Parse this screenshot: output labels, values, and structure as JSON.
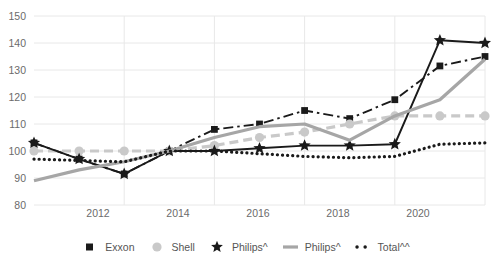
{
  "chart_data": {
    "type": "line",
    "title": "",
    "xlabel": "",
    "ylabel": "",
    "x": [
      2010,
      2011,
      2012,
      2013,
      2014,
      2015,
      2016,
      2017,
      2018,
      2019,
      2020
    ],
    "xlim": [
      2010,
      2020
    ],
    "ylim": [
      80,
      150
    ],
    "ytick_labels": [
      "150",
      "140",
      "130",
      "120",
      "110",
      "100",
      "90",
      "80"
    ],
    "ytick_values": [
      150,
      140,
      130,
      120,
      110,
      100,
      90,
      80
    ],
    "xtick_labels": [
      "2012",
      "2014",
      "2016",
      "2018",
      "2020"
    ],
    "xtick_values": [
      2012,
      2014,
      2016,
      2018,
      2020
    ],
    "grid": true,
    "legend_position": "bottom",
    "series": [
      {
        "name": "Exxon",
        "marker": "square",
        "color": "#1a1a1a",
        "style": "dash-dot",
        "values": [
          103,
          97,
          91.5,
          100,
          108,
          110,
          115,
          112,
          119,
          131.5,
          135
        ]
      },
      {
        "name": "Shell",
        "marker": "circle",
        "color": "#c9c9c9",
        "style": "dashed",
        "values": [
          100,
          100,
          100,
          100,
          102,
          105,
          107,
          110,
          113,
          113,
          113
        ]
      },
      {
        "name": "Philips^",
        "marker": "star",
        "color": "#1a1a1a",
        "style": "solid",
        "values": [
          103,
          97,
          91.5,
          100,
          100,
          101,
          102,
          102,
          102.5,
          141,
          140
        ]
      },
      {
        "name": "Philips^",
        "marker": "none",
        "color": "#a6a6a6",
        "style": "solid",
        "values": [
          89,
          93,
          96,
          100,
          105,
          109,
          110,
          104,
          113,
          119,
          134
        ]
      },
      {
        "name": "Total^^",
        "marker": "dot",
        "color": "#1a1a1a",
        "style": "dotted",
        "values": [
          97,
          96.5,
          96,
          100,
          100,
          99,
          98,
          97.5,
          98,
          102.5,
          103
        ]
      }
    ]
  },
  "legend": {
    "items": [
      {
        "label": "Exxon",
        "icon": "filled-square-marker"
      },
      {
        "label": "Shell",
        "icon": "filled-circle-marker"
      },
      {
        "label": "Philips^",
        "icon": "filled-star-marker"
      },
      {
        "label": "Philips^",
        "icon": "solid-line-swatch"
      },
      {
        "label": "Total^^",
        "icon": "dotted-line-swatch"
      }
    ]
  }
}
